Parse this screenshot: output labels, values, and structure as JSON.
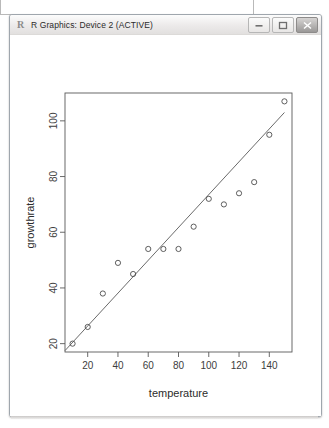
{
  "window": {
    "title": "R Graphics: Device 2 (ACTIVE)",
    "icon": "r-logo-icon",
    "controls": {
      "minimize": "Minimize",
      "maximize": "Maximize",
      "close": "Close"
    },
    "colors": {
      "titlebar": "#eceaea",
      "client": "#ffffff",
      "plot_ink": "#595959",
      "close_button": "#9a9897"
    }
  },
  "chart_data": {
    "type": "scatter",
    "title": "",
    "xlabel": "temperature",
    "ylabel": "growthrate",
    "x": [
      10,
      20,
      30,
      40,
      50,
      60,
      70,
      80,
      90,
      100,
      110,
      120,
      130,
      140,
      150
    ],
    "y": [
      20,
      26,
      38,
      49,
      45,
      54,
      54,
      54,
      62,
      72,
      70,
      74,
      78,
      95,
      107
    ],
    "series": [
      {
        "name": "observations",
        "marker": "open-circle",
        "values": [
          20,
          26,
          38,
          49,
          45,
          54,
          54,
          54,
          62,
          72,
          70,
          74,
          78,
          95,
          107
        ]
      }
    ],
    "fit_line": {
      "type": "linear-regression",
      "x": [
        5,
        150
      ],
      "y": [
        17.5,
        103.0
      ]
    },
    "xlim": [
      5,
      155
    ],
    "ylim": [
      17,
      110
    ],
    "xticks": [
      20,
      40,
      60,
      80,
      100,
      120,
      140
    ],
    "yticks": [
      20,
      40,
      60,
      80,
      100
    ],
    "grid": false,
    "legend": null
  }
}
